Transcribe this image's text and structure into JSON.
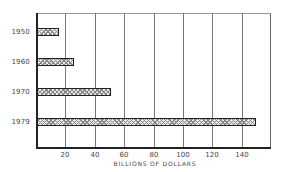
{
  "chart_data": {
    "type": "bar",
    "orientation": "horizontal",
    "title": "",
    "categories": [
      "1950",
      "1960",
      "1970",
      "1979"
    ],
    "values": [
      15,
      25,
      50,
      149
    ],
    "xlabel": "BILLIONS OF DOLLARS",
    "ylabel": "",
    "xlim": [
      0,
      159
    ],
    "xticks": [
      "20",
      "40",
      "60",
      "80",
      "100",
      "120",
      "140"
    ],
    "grid": "vertical",
    "legend": "none",
    "bar_fill": "crosshatch"
  },
  "colors": {
    "axis": "#222222",
    "grid": "#777777",
    "bar_fill": "#e8e8e8",
    "text": "#444444"
  }
}
